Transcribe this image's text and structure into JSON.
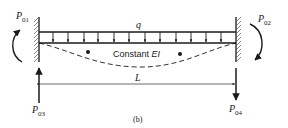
{
  "figure": {
    "caption": "(b)",
    "beam_label": "Constant",
    "beam_property": "EI",
    "load_label": "q",
    "span_label": "L",
    "forces": [
      {
        "id": "P01",
        "base": "P",
        "sub": "01",
        "kind": "moment",
        "position": "left-top",
        "direction": "counterclockwise"
      },
      {
        "id": "P02",
        "base": "P",
        "sub": "02",
        "kind": "moment",
        "position": "right-top",
        "direction": "clockwise"
      },
      {
        "id": "P03",
        "base": "P",
        "sub": "03",
        "kind": "force",
        "position": "left-bottom",
        "direction": "up"
      },
      {
        "id": "P04",
        "base": "P",
        "sub": "04",
        "kind": "force",
        "position": "right-bottom",
        "direction": "down"
      }
    ],
    "supports": {
      "left": "fixed",
      "right": "fixed"
    },
    "load_arrows": 17,
    "colors": {
      "ink": "#1a1a1a",
      "background": "#ffffff"
    }
  }
}
